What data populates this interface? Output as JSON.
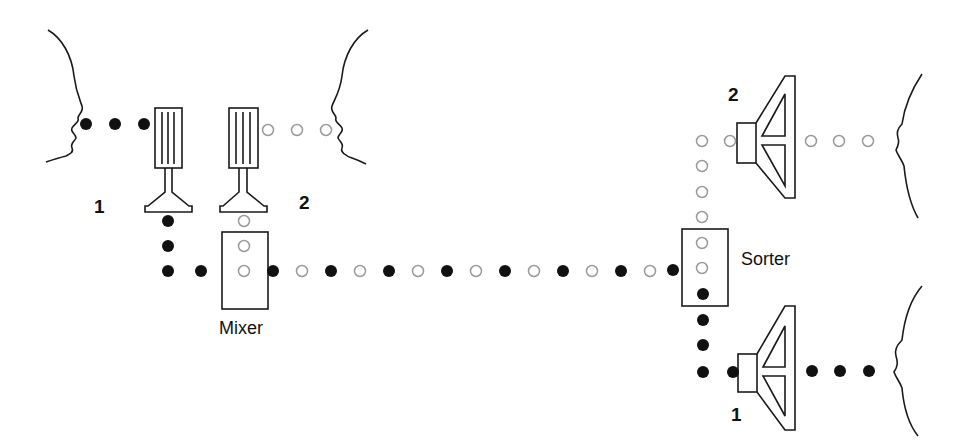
{
  "diagram": {
    "type": "signal-multiplexing",
    "colors": {
      "line": "#1a1a1a",
      "signal1": "#111111",
      "signal2_stroke": "#9a9a9a",
      "background": "#ffffff"
    },
    "labels": {
      "mic1": "1",
      "mic2": "2",
      "mixer": "Mixer",
      "sorter": "Sorter",
      "speaker2": "2",
      "speaker1": "1"
    },
    "nodes": [
      {
        "id": "speaker-face-1",
        "kind": "face",
        "role": "talker 1"
      },
      {
        "id": "microphone-1",
        "kind": "microphone"
      },
      {
        "id": "speaker-face-2",
        "kind": "face",
        "role": "talker 2"
      },
      {
        "id": "microphone-2",
        "kind": "microphone"
      },
      {
        "id": "mixer",
        "kind": "box"
      },
      {
        "id": "sorter",
        "kind": "box"
      },
      {
        "id": "loudspeaker-2",
        "kind": "loudspeaker"
      },
      {
        "id": "loudspeaker-1",
        "kind": "loudspeaker"
      },
      {
        "id": "listener-face-2",
        "kind": "face"
      },
      {
        "id": "listener-face-1",
        "kind": "face"
      }
    ],
    "signals": {
      "signal_1": "filled black dots",
      "signal_2": "hollow grey dots"
    }
  }
}
